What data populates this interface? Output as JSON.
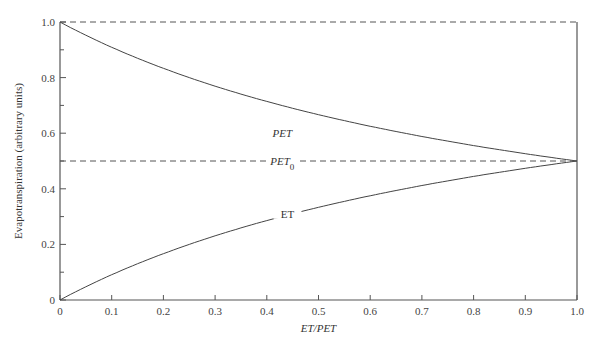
{
  "chart_data": {
    "type": "line",
    "title": "",
    "xlabel": "ET/PET",
    "ylabel": "Evapotranspiration (arbitrary units)",
    "xlim": [
      0,
      1.0
    ],
    "ylim": [
      0,
      1.0
    ],
    "x_ticks": [
      "0",
      "0.1",
      "0.2",
      "0.3",
      "0.4",
      "0.5",
      "0.6",
      "0.7",
      "0.8",
      "0.9",
      "1.0"
    ],
    "y_ticks": [
      "0",
      "0.2",
      "0.4",
      "0.6",
      "0.8",
      "1.0"
    ],
    "grid": false,
    "legend": "none (inline curve labels)",
    "x": [
      0,
      0.1,
      0.2,
      0.3,
      0.4,
      0.5,
      0.6,
      0.7,
      0.8,
      0.9,
      1.0
    ],
    "series": [
      {
        "name": "PET",
        "style": "solid",
        "values": [
          1.0,
          0.91,
          0.83,
          0.77,
          0.71,
          0.67,
          0.62,
          0.59,
          0.56,
          0.53,
          0.5
        ]
      },
      {
        "name": "ET",
        "style": "solid",
        "values": [
          0.0,
          0.09,
          0.17,
          0.23,
          0.29,
          0.33,
          0.38,
          0.41,
          0.44,
          0.47,
          0.5
        ]
      },
      {
        "name": "PET0",
        "style": "dashed",
        "values": [
          0.5,
          0.5,
          0.5,
          0.5,
          0.5,
          0.5,
          0.5,
          0.5,
          0.5,
          0.5,
          0.5
        ]
      },
      {
        "name": "upper reference",
        "style": "dashed",
        "values": [
          1.0,
          1.0,
          1.0,
          1.0,
          1.0,
          1.0,
          1.0,
          1.0,
          1.0,
          1.0,
          1.0
        ]
      }
    ],
    "annotations": [
      {
        "text": "PET",
        "x": 0.43,
        "y": 0.6
      },
      {
        "text": "PET",
        "subscript": "0",
        "x": 0.43,
        "y": 0.5
      },
      {
        "text": "ET",
        "x": 0.44,
        "y": 0.31
      }
    ]
  }
}
